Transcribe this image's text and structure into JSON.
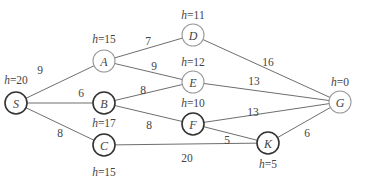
{
  "diagram": {
    "type": "weighted-graph-heuristic-search",
    "nodes": [
      {
        "id": "S",
        "label": "S",
        "h_label": "h=20",
        "h": 20,
        "x": 16,
        "y": 103,
        "style": "dark",
        "h_x": 16,
        "h_y": 84
      },
      {
        "id": "A",
        "label": "A",
        "h_label": "h=15",
        "h": 15,
        "x": 104,
        "y": 61,
        "style": "light",
        "h_x": 104,
        "h_y": 43
      },
      {
        "id": "B",
        "label": "B",
        "h_label": "h=17",
        "h": 17,
        "x": 104,
        "y": 103,
        "style": "dark",
        "h_x": 104,
        "h_y": 127
      },
      {
        "id": "C",
        "label": "C",
        "h_label": "h=15",
        "h": 15,
        "x": 104,
        "y": 145,
        "style": "dark",
        "h_x": 104,
        "h_y": 176
      },
      {
        "id": "D",
        "label": "D",
        "h_label": "h=11",
        "h": 11,
        "x": 193,
        "y": 35,
        "style": "light",
        "h_x": 193,
        "h_y": 19
      },
      {
        "id": "E",
        "label": "E",
        "h_label": "h=12",
        "h": 12,
        "x": 193,
        "y": 82,
        "style": "light",
        "h_x": 193,
        "h_y": 66
      },
      {
        "id": "F",
        "label": "F",
        "h_label": "h=10",
        "h": 10,
        "x": 193,
        "y": 124,
        "style": "dark",
        "h_x": 193,
        "h_y": 107
      },
      {
        "id": "K",
        "label": "K",
        "h_label": "h=5",
        "h": 5,
        "x": 268,
        "y": 143,
        "style": "dark",
        "h_x": 268,
        "h_y": 168
      },
      {
        "id": "G",
        "label": "G",
        "h_label": "h=0",
        "h": 0,
        "x": 340,
        "y": 102,
        "style": "light",
        "h_x": 340,
        "h_y": 86
      }
    ],
    "edges": [
      {
        "from": "S",
        "to": "A",
        "weight": "9",
        "lx": 40,
        "ly": 74
      },
      {
        "from": "S",
        "to": "B",
        "weight": "6",
        "lx": 81,
        "ly": 97
      },
      {
        "from": "S",
        "to": "C",
        "weight": "8",
        "lx": 60,
        "ly": 137
      },
      {
        "from": "A",
        "to": "D",
        "weight": "7",
        "lx": 148,
        "ly": 45
      },
      {
        "from": "A",
        "to": "E",
        "weight": "9",
        "lx": 154,
        "ly": 70
      },
      {
        "from": "B",
        "to": "E",
        "weight": "8",
        "lx": 143,
        "ly": 94
      },
      {
        "from": "B",
        "to": "F",
        "weight": "8",
        "lx": 149,
        "ly": 129
      },
      {
        "from": "C",
        "to": "K",
        "weight": "20",
        "lx": 187,
        "ly": 162
      },
      {
        "from": "D",
        "to": "G",
        "weight": "16",
        "lx": 268,
        "ly": 66
      },
      {
        "from": "E",
        "to": "G",
        "weight": "13",
        "lx": 254,
        "ly": 85
      },
      {
        "from": "F",
        "to": "G",
        "weight": "13",
        "lx": 253,
        "ly": 116
      },
      {
        "from": "F",
        "to": "K",
        "weight": "5",
        "lx": 227,
        "ly": 144
      },
      {
        "from": "K",
        "to": "G",
        "weight": "6",
        "lx": 307,
        "ly": 137
      }
    ],
    "colors": {
      "edge": "#6e6e6e",
      "node_dark_stroke": "#333333",
      "node_light_stroke": "#9a9a9a",
      "text": "#444444",
      "background": "#ffffff"
    },
    "node_radius": 11
  }
}
